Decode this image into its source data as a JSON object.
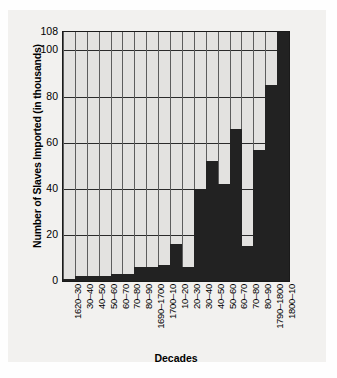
{
  "chart_data": {
    "type": "bar",
    "title": "",
    "xlabel": "Decades",
    "ylabel": "Number of Slaves Imported (in thousands)",
    "ylim": [
      0,
      108
    ],
    "yticks": [
      0,
      20,
      40,
      60,
      80,
      100,
      108
    ],
    "ytick_labels": [
      "0",
      "20",
      "40",
      "60",
      "80",
      "100",
      "108"
    ],
    "grid": true,
    "legend": "none",
    "categories": [
      "1620–30",
      "30–40",
      "40–50",
      "50–60",
      "60–70",
      "70–80",
      "80–90",
      "1690–1700",
      "1700–10",
      "10–20",
      "20–30",
      "30–40",
      "40–50",
      "50–60",
      "60–70",
      "70–80",
      "80–90",
      "1790–1800",
      "1800–10"
    ],
    "values": [
      1,
      2,
      2,
      2,
      3,
      3,
      6,
      6,
      7,
      16,
      6,
      40,
      52,
      42,
      66,
      15,
      57,
      85,
      108
    ],
    "bar_color": "#222222",
    "plot_background": "#e3e2e0",
    "grid_color": "#2b2b2b",
    "axis_color": "#1a1a1a"
  }
}
